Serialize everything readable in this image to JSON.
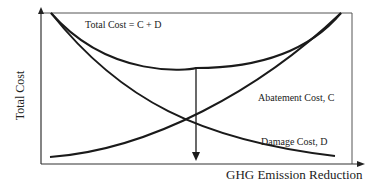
{
  "diagram": {
    "title": "",
    "x_axis_label": "GHG Emission Reduction",
    "y_axis_label": "Total Cost",
    "curves": [
      {
        "id": "total",
        "label": "Total Cost = C + D",
        "shape": "U-shaped"
      },
      {
        "id": "abatement",
        "label": "Abatement Cost, C",
        "shape": "increasing convex"
      },
      {
        "id": "damage",
        "label": "Damage Cost, D",
        "shape": "decreasing convex"
      }
    ],
    "annotation": "downward arrow from minimum of total cost to x-axis (optimal reduction)",
    "colors": {
      "line": "#1a1a1a",
      "frame": "#555555",
      "background": "#ffffff"
    }
  }
}
